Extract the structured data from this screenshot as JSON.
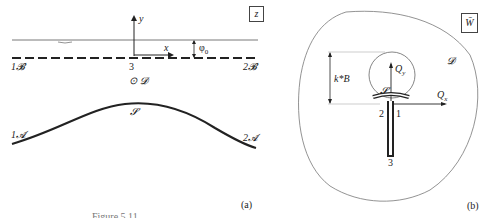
{
  "panel_a": {
    "plane_label": "z",
    "axis_y": "y",
    "axis_x": "x",
    "phi": "φ",
    "phi_sub": "0",
    "left_B": "1𝓑",
    "right_B": "2𝓑",
    "point_3": "3",
    "domain": "⊙ 𝓓",
    "curve_label": "𝓢",
    "left_A": "1𝓐",
    "right_A": "2𝓐",
    "tag": "(a)"
  },
  "panel_b": {
    "plane_label": "W̄",
    "domain": "𝓓",
    "kB": "k*B",
    "Qy": "Q",
    "Qy_sub": "y",
    "Qx": "Q",
    "Qx_sub": "x",
    "S": "𝓢",
    "p1": "1",
    "p2": "2",
    "p3": "3",
    "tag": "(b)"
  },
  "caption": "Figure 5.11"
}
